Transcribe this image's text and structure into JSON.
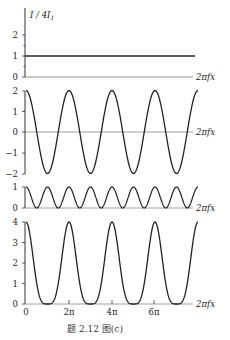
{
  "chart_data": [
    {
      "type": "line",
      "panel": 1,
      "ylabel": "I / 4I₁",
      "xlabel": "2πfx",
      "yticks": [
        0,
        1,
        2
      ],
      "ylim": [
        0,
        2.5
      ],
      "formula": "1",
      "description": "constant line at I/4I₁ = 1",
      "x": [
        0,
        25.13
      ],
      "values": [
        1,
        1
      ]
    },
    {
      "type": "line",
      "panel": 2,
      "xlabel": "2πfx",
      "yticks": [
        -2,
        -1,
        0,
        1,
        2
      ],
      "ylim": [
        -2,
        2
      ],
      "formula": "2cos(2πfx)",
      "description": "cosine of amplitude 2, peaks at 0, 2π, 4π, 6π, 8π"
    },
    {
      "type": "line",
      "panel": 3,
      "xlabel": "2πfx",
      "yticks": [
        0,
        1
      ],
      "ylim": [
        0,
        1
      ],
      "formula": "cos²(2πfx)",
      "description": "period π, oscillating between 0 and 1"
    },
    {
      "type": "line",
      "panel": 4,
      "xlabel": "2πfx",
      "yticks": [
        0,
        1,
        2,
        3,
        4
      ],
      "ylim": [
        0,
        4
      ],
      "xticks": [
        "0",
        "2π",
        "4π",
        "6π"
      ],
      "formula": "(1+cos(2πfx))²",
      "description": "peaks of 4 at 0, 2π, 4π, 6π with flat minima at odd π"
    }
  ],
  "labels": {
    "ylabel_top": "I / 4I",
    "ylabel_sub": "1",
    "xaxis": "2πfx",
    "xticks": [
      "0",
      "2π",
      "4π",
      "6π"
    ],
    "panel1_yticks": [
      "0",
      "1",
      "2"
    ],
    "panel2_yticks": [
      "2",
      "1",
      "0",
      "−1",
      "−2"
    ],
    "panel3_yticks": [
      "1",
      "0"
    ],
    "panel4_yticks": [
      "4",
      "3",
      "2",
      "1",
      "0"
    ]
  },
  "caption": "题 2.12 图(c)"
}
